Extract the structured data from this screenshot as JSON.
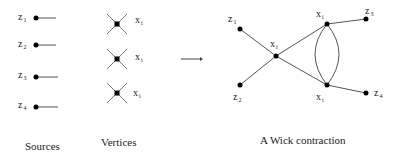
{
  "sources": {
    "caption": "Sources",
    "items": [
      {
        "var": "z",
        "sub": "1"
      },
      {
        "var": "z",
        "sub": "2"
      },
      {
        "var": "z",
        "sub": "3"
      },
      {
        "var": "z",
        "sub": "4"
      }
    ]
  },
  "vertices": {
    "caption": "Vertices",
    "items": [
      {
        "var": "x",
        "sub": "i"
      },
      {
        "var": "x",
        "sub": "i"
      },
      {
        "var": "x",
        "sub": "i"
      }
    ]
  },
  "contraction": {
    "caption": "A Wick contraction",
    "nodes": {
      "z1": {
        "var": "z",
        "sub": "1"
      },
      "z2": {
        "var": "z",
        "sub": "2"
      },
      "z3": {
        "var": "z",
        "sub": "3"
      },
      "z4": {
        "var": "z",
        "sub": "4"
      },
      "x_center": {
        "var": "x",
        "sub": "i"
      },
      "x_top": {
        "var": "x",
        "sub": "i"
      },
      "x_bottom": {
        "var": "x",
        "sub": "i"
      }
    }
  }
}
